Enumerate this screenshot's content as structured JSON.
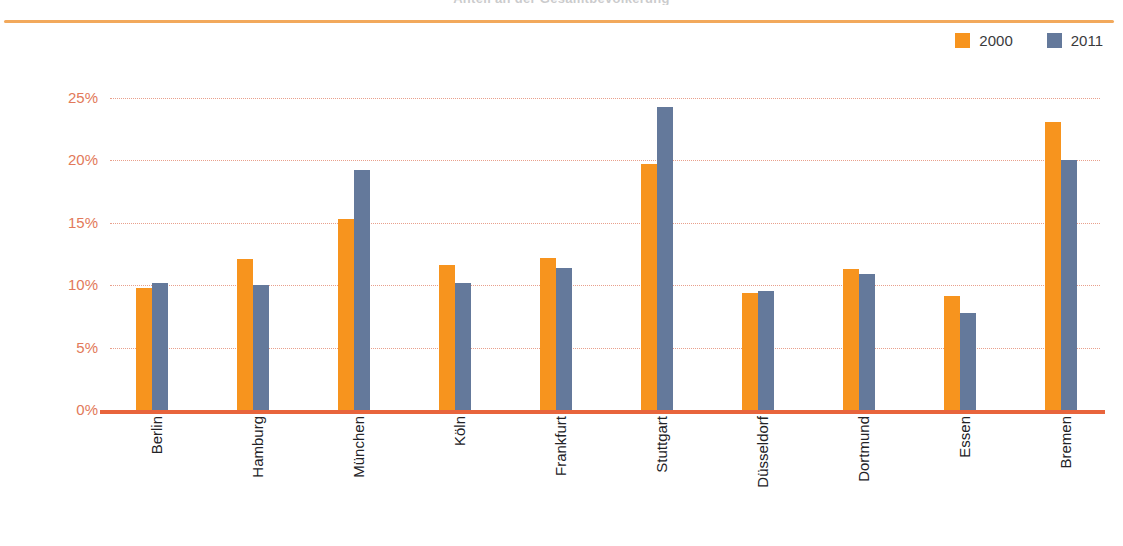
{
  "title_sliver": "Anteil an der Gesamtbevölkerung",
  "legend": {
    "position": "top-right",
    "entries": [
      {
        "label": "2000",
        "color": "#F7941E",
        "swatch": "legend-swatch-2000"
      },
      {
        "label": "2011",
        "color": "#64799B",
        "swatch": "legend-swatch-2011"
      }
    ]
  },
  "axis": {
    "y_ticks": [
      "0%",
      "5%",
      "10%",
      "15%",
      "20%",
      "25%"
    ],
    "y_tick_color": "#E2795A",
    "gridline_color": "#E9A08C",
    "baseline_color": "#E8643C",
    "top_rule_color": "#F2A95C"
  },
  "chart_data": {
    "type": "bar",
    "title": "Anteil an der Gesamtbevölkerung",
    "xlabel": "",
    "ylabel": "",
    "ylim": [
      0,
      25
    ],
    "ytick_values": [
      0,
      5,
      10,
      15,
      20,
      25
    ],
    "ytick_labels": [
      "0%",
      "5%",
      "10%",
      "15%",
      "20%",
      "25%"
    ],
    "grid": true,
    "legend_position": "top-right",
    "categories": [
      "Berlin",
      "Hamburg",
      "München",
      "Köln",
      "Frankfurt",
      "Stuttgart",
      "Düsseldorf",
      "Dortmund",
      "Essen",
      "Bremen"
    ],
    "series": [
      {
        "name": "2000",
        "color": "#F7941E",
        "values": [
          9.8,
          12.1,
          15.3,
          11.6,
          12.2,
          19.7,
          9.4,
          11.3,
          9.1,
          23.1
        ]
      },
      {
        "name": "2011",
        "color": "#64799B",
        "values": [
          10.2,
          10.0,
          19.2,
          10.2,
          11.4,
          24.3,
          9.5,
          10.9,
          7.8,
          20.0
        ]
      }
    ]
  }
}
